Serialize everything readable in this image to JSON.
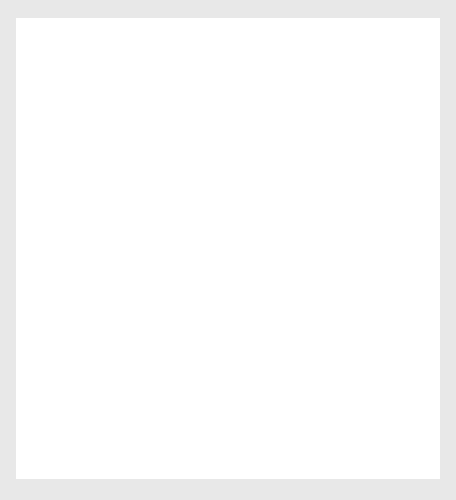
{
  "page": {
    "background_color": "#e8e8e8",
    "paper_color": "#ffffff"
  },
  "chart_data": [
    {
      "id": "top",
      "type": "line",
      "title": "",
      "subtitle": "",
      "xlabel": "Months",
      "ylabel": "Level",
      "ylim": [
        80,
        180
      ],
      "yticks": [
        80,
        100,
        120,
        140,
        160,
        180
      ],
      "ytick_labels": [
        "80",
        "100",
        "120",
        "140",
        "160",
        "180"
      ],
      "xlim": [
        0,
        59
      ],
      "xticks_count": 60,
      "xtick_labels": [],
      "grid": false,
      "legend": null,
      "line_color": "#262626",
      "series": [
        {
          "name": "Level",
          "x": [
            0,
            1,
            2,
            3,
            4,
            5,
            6,
            7,
            8,
            9,
            10,
            11,
            12,
            13,
            14,
            15,
            16,
            17,
            18,
            19,
            20,
            21,
            22,
            23,
            24,
            25,
            26,
            27,
            28,
            29,
            30,
            31,
            32,
            33,
            34,
            35,
            36,
            37,
            38,
            39,
            40,
            41,
            42,
            43,
            44,
            45,
            46,
            47,
            48,
            49,
            50,
            51,
            52,
            53,
            54,
            55,
            56,
            57,
            58,
            59
          ],
          "values": [
            100.2,
            99.0,
            97.5,
            96.2,
            94.8,
            93.5,
            95.6,
            88.0,
            92.0,
            95.0,
            95.4,
            93.8,
            95.0,
            91.0,
            92.6,
            88.5,
            91.0,
            93.5,
            94.0,
            96.5,
            98.6,
            100.6,
            99.6,
            98.2,
            99.0,
            103.0,
            105.0,
            109.2,
            107.8,
            108.2,
            110.0,
            113.0,
            115.4,
            111.0,
            108.4,
            113.5,
            120.0,
            125.0,
            131.0,
            130.2,
            133.0,
            135.4,
            128.4,
            133.0,
            139.0,
            142.0,
            151.0,
            143.2,
            154.2,
            145.8,
            142.6,
            146.2,
            146.8,
            154.0,
            163.0,
            167.6,
            166.0,
            152.4,
            121.0,
            140.6
          ]
        }
      ]
    },
    {
      "id": "bottom",
      "type": "line",
      "title": "",
      "subtitle": "",
      "xlabel": "Months",
      "ylabel": "Level",
      "ylim": [
        80,
        220
      ],
      "yticks": [
        80,
        100,
        120,
        140,
        160,
        180,
        200,
        220
      ],
      "ytick_labels": [
        "80",
        "100",
        "120",
        "140",
        "160",
        "180",
        "200",
        "220"
      ],
      "xlim": [
        0,
        59
      ],
      "xticks_count": 60,
      "xtick_labels": [],
      "grid": false,
      "legend": null,
      "line_color": "#262626",
      "series": [
        {
          "name": "Level",
          "x": [
            0,
            1,
            2,
            3,
            4,
            5,
            6,
            7,
            8,
            9,
            10,
            11,
            12,
            13,
            14,
            15,
            16,
            17,
            18,
            19,
            20,
            21,
            22,
            23,
            24,
            25,
            26,
            27,
            28,
            29,
            30,
            31,
            32,
            33,
            34,
            35,
            36,
            37,
            38,
            39,
            40,
            41,
            42,
            43,
            44,
            45,
            46,
            47,
            48,
            49,
            50,
            51,
            52,
            53,
            54,
            55,
            56,
            57,
            58,
            59
          ],
          "values": [
            98.0,
            104.0,
            113.0,
            122.0,
            127.0,
            124.0,
            114.0,
            106.0,
            104.5,
            106.0,
            103.0,
            102.0,
            103.0,
            99.0,
            104.5,
            105.0,
            102.0,
            101.0,
            104.5,
            102.0,
            103.0,
            101.5,
            97.5,
            106.0,
            116.0,
            123.0,
            124.5,
            131.0,
            136.0,
            130.5,
            131.5,
            132.5,
            141.0,
            144.0,
            143.0,
            157.0,
            172.0,
            163.0,
            175.0,
            175.0,
            168.0,
            160.0,
            171.0,
            180.0,
            194.0,
            185.0,
            187.0,
            212.0,
            196.0,
            216.0,
            196.0,
            209.0,
            205.0,
            193.0,
            194.0,
            173.0,
            167.5,
            169.0,
            150.5,
            156.0
          ]
        }
      ]
    }
  ]
}
